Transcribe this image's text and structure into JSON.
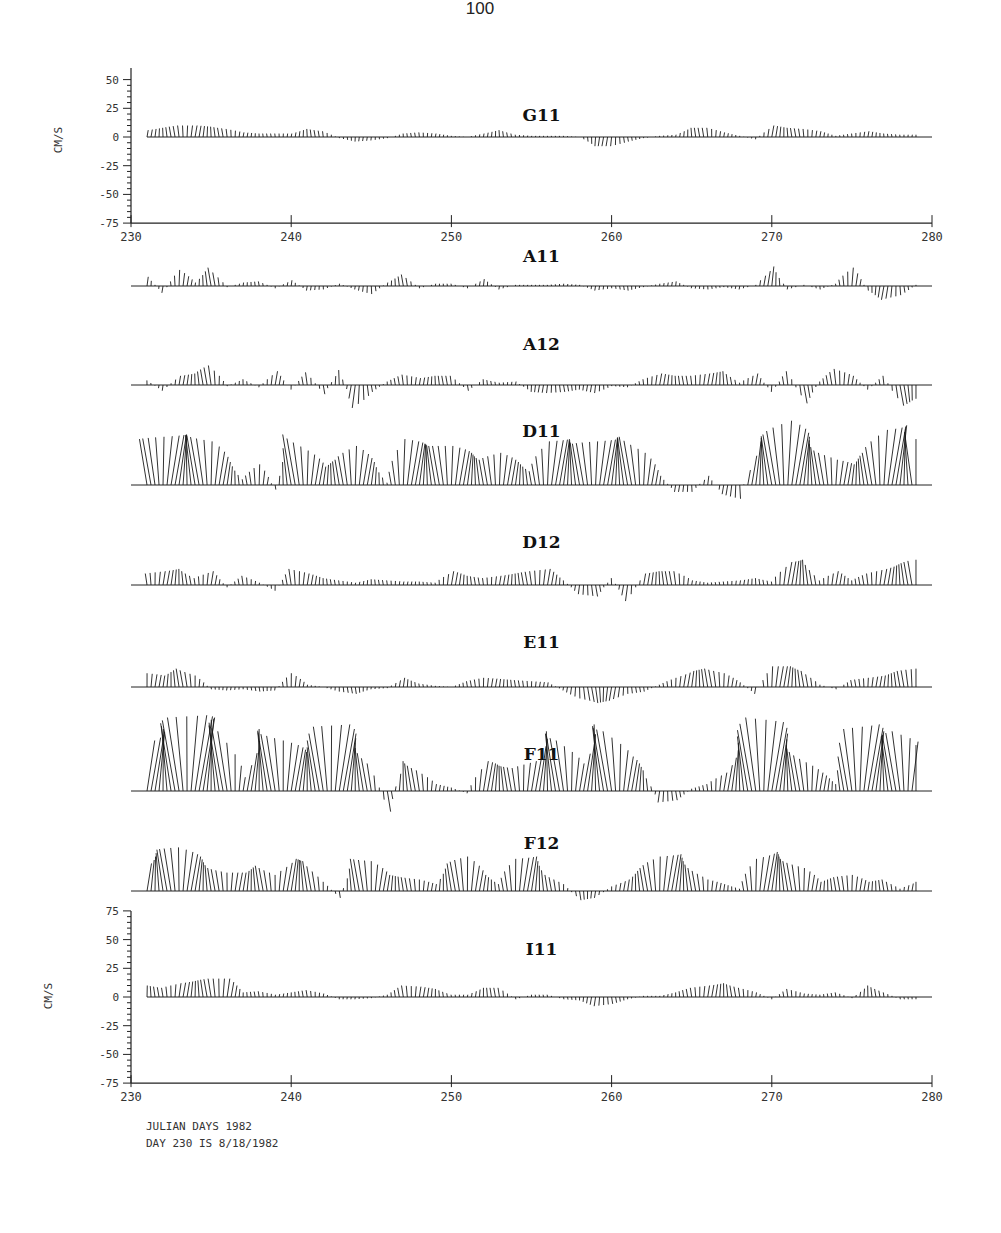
{
  "page_number": "100",
  "chart_data": {
    "type": "stick-plot",
    "title": "",
    "xlabel": "JULIAN DAYS 1982",
    "note": "DAY 230 IS  8/18/1982",
    "xlim": [
      230,
      280
    ],
    "x_ticks": [
      "230",
      "240",
      "250",
      "260",
      "270",
      "280"
    ],
    "top_axis": {
      "ylabel": "CM/S",
      "ylim": [
        -75,
        50
      ],
      "y_ticks": [
        "50",
        "25",
        "0",
        "-25",
        "-50",
        "-75"
      ]
    },
    "bottom_axis": {
      "ylabel": "CM/S",
      "ylim": [
        -75,
        75
      ],
      "y_ticks": [
        "75",
        "50",
        "25",
        "0",
        "-25",
        "-50",
        "-75"
      ]
    },
    "day_range_plotted": [
      231,
      279
    ],
    "series": [
      {
        "name": "G11",
        "days": [
          231,
          232,
          233,
          234,
          235,
          236,
          237,
          238,
          239,
          240,
          241,
          242,
          243,
          244,
          245,
          246,
          247,
          248,
          249,
          250,
          251,
          252,
          253,
          254,
          255,
          256,
          257,
          258,
          259,
          260,
          261,
          262,
          263,
          264,
          265,
          266,
          267,
          268,
          269,
          270,
          271,
          272,
          273,
          274,
          275,
          276,
          277,
          278,
          279
        ],
        "values": [
          6,
          8,
          10,
          10,
          9,
          7,
          4,
          3,
          3,
          3,
          7,
          5,
          -1,
          -4,
          -3,
          -1,
          3,
          4,
          3,
          1,
          0,
          3,
          6,
          2,
          1,
          1,
          1,
          0,
          -8,
          -8,
          -4,
          -1,
          1,
          2,
          8,
          8,
          4,
          1,
          -2,
          10,
          8,
          7,
          5,
          1,
          3,
          5,
          3,
          2,
          2
        ]
      },
      {
        "name": "A11",
        "days": [
          231,
          232,
          233,
          234,
          235,
          236,
          237,
          238,
          239,
          240,
          241,
          242,
          243,
          244,
          245,
          246,
          247,
          248,
          249,
          250,
          251,
          252,
          253,
          254,
          255,
          256,
          257,
          258,
          259,
          260,
          261,
          262,
          263,
          264,
          265,
          266,
          267,
          268,
          269,
          270,
          271,
          272,
          273,
          274,
          275,
          276,
          277,
          278,
          279
        ],
        "values": [
          8,
          -6,
          14,
          3,
          16,
          -1,
          3,
          4,
          -2,
          5,
          -4,
          -3,
          2,
          -3,
          -7,
          3,
          10,
          -2,
          2,
          2,
          -2,
          6,
          -3,
          1,
          1,
          1,
          2,
          1,
          -4,
          -2,
          -4,
          -1,
          2,
          4,
          -2,
          -3,
          -1,
          -3,
          1,
          17,
          -3,
          1,
          -3,
          2,
          16,
          -4,
          -12,
          -8,
          1
        ]
      },
      {
        "name": "A12",
        "days": [
          231,
          232,
          233,
          234,
          235,
          236,
          237,
          238,
          239,
          240,
          241,
          242,
          243,
          244,
          245,
          246,
          247,
          248,
          249,
          250,
          251,
          252,
          253,
          254,
          255,
          256,
          257,
          258,
          259,
          260,
          261,
          262,
          263,
          264,
          265,
          266,
          267,
          268,
          269,
          270,
          271,
          272,
          273,
          274,
          275,
          276,
          277,
          278,
          279
        ],
        "values": [
          4,
          -5,
          8,
          10,
          17,
          -1,
          5,
          -2,
          12,
          -4,
          11,
          -8,
          13,
          -20,
          -6,
          3,
          9,
          6,
          8,
          8,
          -5,
          5,
          2,
          3,
          -6,
          -7,
          -6,
          -4,
          -7,
          -1,
          -2,
          5,
          10,
          8,
          8,
          10,
          12,
          2,
          10,
          -6,
          12,
          -16,
          3,
          14,
          8,
          -4,
          8,
          -18,
          -12
        ]
      },
      {
        "name": "D11",
        "days": [
          231,
          232,
          233,
          234,
          235,
          236,
          237,
          238,
          239,
          240,
          241,
          242,
          243,
          244,
          245,
          246,
          247,
          248,
          249,
          250,
          251,
          252,
          253,
          254,
          255,
          256,
          257,
          258,
          259,
          260,
          261,
          262,
          263,
          264,
          265,
          266,
          267,
          268,
          269,
          270,
          271,
          272,
          273,
          274,
          275,
          276,
          277,
          278,
          279
        ],
        "values": [
          40,
          42,
          44,
          43,
          38,
          20,
          5,
          18,
          -4,
          44,
          30,
          16,
          22,
          34,
          20,
          2,
          40,
          36,
          34,
          34,
          28,
          22,
          28,
          20,
          12,
          38,
          40,
          36,
          38,
          40,
          42,
          28,
          8,
          -6,
          -6,
          8,
          -8,
          -12,
          38,
          44,
          56,
          42,
          30,
          22,
          18,
          28,
          48,
          52,
          40,
          24,
          34,
          24,
          10,
          30,
          36,
          42,
          48,
          42,
          28
        ]
      },
      {
        "name": "D12",
        "days": [
          231,
          232,
          233,
          234,
          235,
          236,
          237,
          238,
          239,
          240,
          241,
          242,
          243,
          244,
          245,
          246,
          247,
          248,
          249,
          250,
          251,
          252,
          253,
          254,
          255,
          256,
          257,
          258,
          259,
          260,
          261,
          262,
          263,
          264,
          265,
          266,
          267,
          268,
          269,
          270,
          271,
          272,
          273,
          274,
          275,
          276,
          277,
          278,
          279
        ],
        "values": [
          10,
          12,
          14,
          6,
          12,
          -2,
          8,
          2,
          -5,
          14,
          10,
          6,
          4,
          2,
          5,
          4,
          3,
          3,
          2,
          12,
          8,
          6,
          8,
          10,
          12,
          14,
          4,
          -8,
          -10,
          6,
          -14,
          10,
          12,
          12,
          4,
          2,
          3,
          4,
          6,
          3,
          20,
          22,
          4,
          12,
          4,
          10,
          14,
          18,
          22
        ]
      },
      {
        "name": "E11",
        "days": [
          231,
          232,
          233,
          234,
          235,
          236,
          237,
          238,
          239,
          240,
          241,
          242,
          243,
          244,
          245,
          246,
          247,
          248,
          249,
          250,
          251,
          252,
          253,
          254,
          255,
          256,
          257,
          258,
          259,
          260,
          261,
          262,
          263,
          264,
          265,
          266,
          267,
          268,
          269,
          270,
          271,
          272,
          273,
          274,
          275,
          276,
          277,
          278,
          279
        ],
        "values": [
          12,
          10,
          16,
          10,
          -2,
          -3,
          -2,
          -4,
          -3,
          12,
          2,
          0,
          -4,
          -6,
          -2,
          -1,
          8,
          3,
          1,
          0,
          5,
          8,
          7,
          6,
          5,
          4,
          -3,
          -10,
          -14,
          -12,
          -6,
          -4,
          2,
          8,
          14,
          16,
          12,
          4,
          -6,
          18,
          18,
          14,
          2,
          -2,
          6,
          8,
          10,
          14,
          16
        ]
      },
      {
        "name": "F11",
        "days": [
          231,
          232,
          233,
          234,
          235,
          236,
          237,
          238,
          239,
          240,
          241,
          242,
          243,
          244,
          245,
          246,
          247,
          248,
          249,
          250,
          251,
          252,
          253,
          254,
          255,
          256,
          257,
          258,
          259,
          260,
          261,
          262,
          263,
          264,
          265,
          266,
          267,
          268,
          269,
          270,
          271,
          272,
          273,
          274,
          275,
          276,
          277,
          278,
          279
        ],
        "values": [
          44,
          54,
          64,
          66,
          62,
          52,
          12,
          54,
          48,
          40,
          32,
          56,
          58,
          42,
          24,
          -18,
          26,
          18,
          6,
          3,
          -2,
          26,
          22,
          20,
          26,
          52,
          44,
          24,
          58,
          52,
          30,
          18,
          -10,
          -8,
          2,
          6,
          16,
          42,
          64,
          60,
          40,
          28,
          16,
          6,
          54,
          58,
          46,
          52,
          40,
          28,
          28,
          30,
          36,
          38,
          34,
          22,
          4,
          32
        ]
      },
      {
        "name": "F12",
        "days": [
          231,
          232,
          233,
          234,
          235,
          236,
          237,
          238,
          239,
          240,
          241,
          242,
          243,
          244,
          245,
          246,
          247,
          248,
          249,
          250,
          251,
          252,
          253,
          254,
          255,
          256,
          257,
          258,
          259,
          260,
          261,
          262,
          263,
          264,
          265,
          266,
          267,
          268,
          269,
          270,
          271,
          272,
          273,
          274,
          275,
          276,
          277,
          278,
          279
        ],
        "values": [
          24,
          36,
          38,
          30,
          20,
          16,
          16,
          22,
          14,
          28,
          26,
          8,
          -6,
          28,
          26,
          14,
          12,
          10,
          6,
          24,
          30,
          14,
          6,
          28,
          30,
          14,
          6,
          -8,
          -6,
          4,
          10,
          20,
          30,
          32,
          20,
          10,
          6,
          2,
          28,
          34,
          26,
          20,
          8,
          12,
          14,
          8,
          10,
          2,
          8
        ]
      },
      {
        "name": "I11",
        "days": [
          231,
          232,
          233,
          234,
          235,
          236,
          237,
          238,
          239,
          240,
          241,
          242,
          243,
          244,
          245,
          246,
          247,
          248,
          249,
          250,
          251,
          252,
          253,
          254,
          255,
          256,
          257,
          258,
          259,
          260,
          261,
          262,
          263,
          264,
          265,
          266,
          267,
          268,
          269,
          270,
          271,
          272,
          273,
          274,
          275,
          276,
          277,
          278,
          279
        ],
        "values": [
          10,
          8,
          12,
          14,
          16,
          16,
          4,
          5,
          2,
          4,
          6,
          3,
          -2,
          -2,
          -1,
          2,
          10,
          9,
          7,
          2,
          2,
          8,
          8,
          -2,
          2,
          2,
          -2,
          -3,
          -8,
          -6,
          -2,
          1,
          1,
          4,
          8,
          10,
          12,
          8,
          4,
          -2,
          7,
          3,
          2,
          4,
          -1,
          10,
          4,
          -2,
          -2
        ]
      }
    ]
  }
}
